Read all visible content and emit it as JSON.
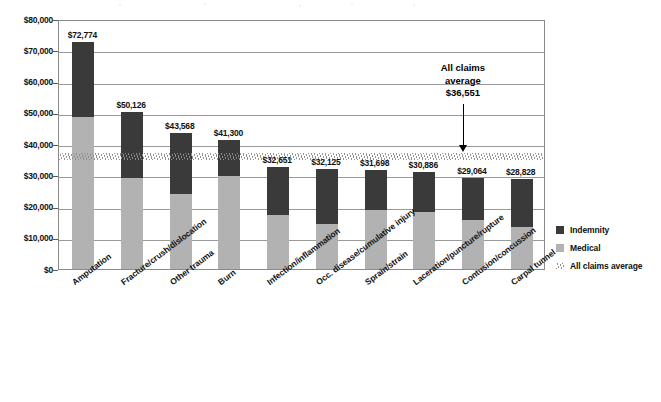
{
  "chart_data": {
    "type": "bar",
    "subtype": "stacked-bar",
    "title": "",
    "xlabel": "",
    "ylabel": "",
    "ylim": [
      0,
      80000
    ],
    "grid": true,
    "legend_position": "right",
    "categories": [
      "Amputation",
      "Fracture/crush/dislocation",
      "Other trauma",
      "Burn",
      "Infection/inflammation",
      "Occ. disease/cumulative injury",
      "Sprain/strain",
      "Laceration/puncture/rupture",
      "Contusion/concussion",
      "Carpal tunnel"
    ],
    "y_ticks": [
      "$0",
      "$10,000",
      "$20,000",
      "$30,000",
      "$40,000",
      "$50,000",
      "$60,000",
      "$70,000",
      "$80,000"
    ],
    "y_tick_values": [
      0,
      10000,
      20000,
      30000,
      40000,
      50000,
      60000,
      70000,
      80000
    ],
    "series": [
      {
        "name": "Medical",
        "color": "#b2b2b2",
        "values": [
          48500,
          29200,
          23900,
          29900,
          17400,
          14300,
          19000,
          18300,
          15600,
          13600
        ]
      },
      {
        "name": "Indemnity",
        "color": "#3a3a3a",
        "values": [
          24274,
          20926,
          19668,
          11400,
          15251,
          17825,
          12698,
          12586,
          13464,
          15228
        ]
      }
    ],
    "totals": [
      72774,
      50126,
      43568,
      41300,
      32651,
      32125,
      31698,
      30886,
      29064,
      28828
    ],
    "total_labels": [
      "$72,774",
      "$50,126",
      "$43,568",
      "$41,300",
      "$32,651",
      "$32,125",
      "$31,698",
      "$30,886",
      "$29,064",
      "$28,828"
    ],
    "reference_line": {
      "name": "All claims average",
      "value": 36551,
      "value_label": "$36,551",
      "color": "#8e8e8e",
      "style": "hatched-band"
    },
    "annotation": {
      "line1": "All claims",
      "line2": "average",
      "line3": "$36,551"
    }
  },
  "legend": {
    "items": [
      {
        "label": "Indemnity",
        "swatch": "dark-square",
        "color": "#3a3a3a"
      },
      {
        "label": "Medical",
        "swatch": "light-square",
        "color": "#b2b2b2"
      },
      {
        "label": "All claims average",
        "swatch": "hatch-band",
        "color": "#8e8e8e"
      }
    ]
  }
}
